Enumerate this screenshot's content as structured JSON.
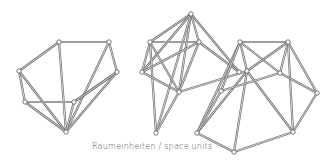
{
  "caption": "Raumeinheiten / space units",
  "structures": [
    {
      "name": "left",
      "nodes": {
        "A": [
          59,
          42
        ],
        "B": [
          109,
          42
        ],
        "C": [
          19,
          71
        ],
        "D": [
          117,
          72
        ],
        "E": [
          25,
          102
        ],
        "F": [
          74,
          102
        ],
        "G": [
          66,
          132
        ]
      },
      "edges": [
        [
          "A",
          "B"
        ],
        [
          "A",
          "C"
        ],
        [
          "A",
          "G"
        ],
        [
          "B",
          "D"
        ],
        [
          "B",
          "G"
        ],
        [
          "C",
          "E"
        ],
        [
          "C",
          "G"
        ],
        [
          "E",
          "F"
        ],
        [
          "E",
          "G"
        ],
        [
          "F",
          "G"
        ],
        [
          "D",
          "F"
        ],
        [
          "D",
          "G"
        ],
        [
          "F",
          "D"
        ]
      ]
    },
    {
      "name": "middle",
      "nodes": {
        "M1": [
          191,
          14
        ],
        "M2": [
          150,
          42
        ],
        "M3": [
          199,
          42
        ],
        "M4": [
          142,
          72
        ],
        "M5": [
          239,
          72
        ],
        "M6": [
          179,
          92
        ],
        "M7": [
          156,
          133
        ]
      },
      "edges": [
        [
          "M1",
          "M2"
        ],
        [
          "M1",
          "M3"
        ],
        [
          "M1",
          "M4"
        ],
        [
          "M1",
          "M6"
        ],
        [
          "M1",
          "M7"
        ],
        [
          "M1",
          "M5"
        ],
        [
          "M2",
          "M3"
        ],
        [
          "M2",
          "M4"
        ],
        [
          "M2",
          "M6"
        ],
        [
          "M2",
          "M7"
        ],
        [
          "M4",
          "M3"
        ],
        [
          "M3",
          "M5"
        ],
        [
          "M3",
          "M6"
        ],
        [
          "M6",
          "M7"
        ],
        [
          "M4",
          "M6"
        ],
        [
          "M6",
          "R3"
        ]
      ]
    },
    {
      "name": "right",
      "nodes": {
        "R1": [
          240,
          42
        ],
        "R2": [
          288,
          42
        ],
        "R3": [
          247,
          71
        ],
        "R4": [
          280,
          73
        ],
        "R5": [
          317,
          93
        ],
        "R6": [
          221,
          91
        ],
        "R7": [
          197,
          133
        ],
        "R8": [
          293,
          132
        ],
        "R9": [
          234,
          152
        ]
      },
      "edges": [
        [
          "R1",
          "R2"
        ],
        [
          "R1",
          "R3"
        ],
        [
          "R1",
          "R4"
        ],
        [
          "R1",
          "R7"
        ],
        [
          "R2",
          "R3"
        ],
        [
          "R2",
          "R4"
        ],
        [
          "R2",
          "R5"
        ],
        [
          "R2",
          "R8"
        ],
        [
          "R3",
          "R8"
        ],
        [
          "R3",
          "R9"
        ],
        [
          "R3",
          "R7"
        ],
        [
          "R4",
          "R5"
        ],
        [
          "R6",
          "R4"
        ],
        [
          "R6",
          "R7"
        ],
        [
          "R5",
          "R8"
        ],
        [
          "R7",
          "R9"
        ],
        [
          "R8",
          "R9"
        ],
        [
          "R6",
          "R1"
        ]
      ]
    }
  ]
}
